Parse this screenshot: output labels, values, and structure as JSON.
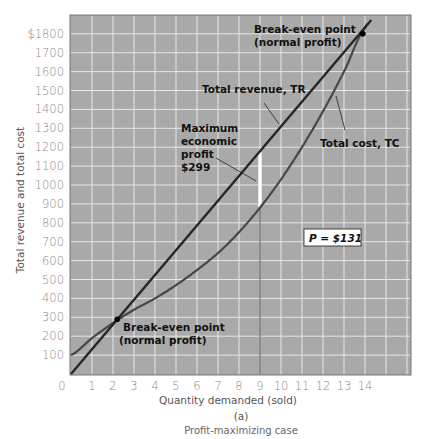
{
  "chart_data": {
    "type": "line",
    "title": "",
    "subtitle": "(a)",
    "caption": "Profit-maximizing case",
    "xlabel": "Quantity demanded (sold)",
    "ylabel": "Total revenue and total cost",
    "x": [
      0,
      1,
      2,
      3,
      4,
      5,
      6,
      7,
      8,
      9,
      10,
      11,
      12,
      13,
      14
    ],
    "xlim": [
      0,
      15
    ],
    "ylim": [
      0,
      1900
    ],
    "xticks": [
      "0",
      "1",
      "2",
      "3",
      "4",
      "5",
      "6",
      "7",
      "8",
      "9",
      "10",
      "11",
      "12",
      "13",
      "14"
    ],
    "yticks": [
      "100",
      "200",
      "300",
      "400",
      "500",
      "600",
      "700",
      "800",
      "900",
      "1000",
      "1100",
      "1200",
      "1300",
      "1400",
      "1500",
      "1600",
      "1700",
      "$1800"
    ],
    "grid": true,
    "legend": "none (inline labels)",
    "series": [
      {
        "name": "Total revenue, TR",
        "values": [
          0,
          131,
          262,
          393,
          524,
          655,
          786,
          917,
          1048,
          1179,
          1310,
          1441,
          1572,
          1703,
          1834
        ]
      },
      {
        "name": "Total cost, TC",
        "values": [
          100,
          190,
          270,
          340,
          400,
          470,
          550,
          640,
          750,
          880,
          1030,
          1200,
          1390,
          1600,
          1830
        ]
      }
    ],
    "annotations": [
      {
        "text": "Break-even point (normal profit)",
        "x": 13.9,
        "y": 1800
      },
      {
        "text": "Break-even point (normal profit)",
        "x": 2.2,
        "y": 290
      },
      {
        "text": "Maximum economic profit $299",
        "x": 9,
        "y_from": 880,
        "y_to": 1179
      },
      {
        "text": "Total revenue, TR"
      },
      {
        "text": "Total cost, TC"
      },
      {
        "text": "P = $131"
      }
    ],
    "price": 131,
    "max_profit": 299,
    "max_profit_quantity": 9
  },
  "labels": {
    "breakeven_top_1": "Break-even point",
    "breakeven_top_2": "(normal profit)",
    "breakeven_bottom_1": "Break-even point",
    "breakeven_bottom_2": "(normal profit)",
    "tr": "Total revenue, TR",
    "tc": "Total cost, TC",
    "profit_1": "Maximum",
    "profit_2": "economic",
    "profit_3": "profit",
    "profit_4": "$299",
    "price_box": "P = $131",
    "xlabel": "Quantity demanded (sold)",
    "ylabel": "Total revenue and total cost",
    "panel": "(a)",
    "caption": "Profit-maximizing case"
  },
  "colors": {
    "plot_bg": "#a9a9a9",
    "grid": "#e6e6e6",
    "tr_line": "#2b2b2b",
    "tc_line": "#4a4a4a",
    "profit_bar": "#ffffff"
  }
}
